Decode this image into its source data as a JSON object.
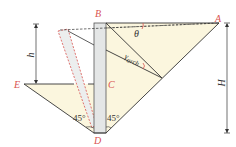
{
  "figure": {
    "type": "retaining-wall soil wedge diagram",
    "points": {
      "A": {
        "label": "A"
      },
      "B": {
        "label": "B"
      },
      "C": {
        "label": "C"
      },
      "D": {
        "label": "D"
      },
      "E": {
        "label": "E"
      }
    },
    "dimensions": {
      "h": {
        "label": "h"
      },
      "H": {
        "label": "H"
      }
    },
    "angles": {
      "theta": {
        "label": "θ"
      },
      "gamma_arch": {
        "label": "γ",
        "subscript": "arch"
      },
      "left_base": {
        "label": "45°"
      },
      "right_base": {
        "label": "45°"
      }
    },
    "colors": {
      "soil_fill": "#fbf6de",
      "wall_fill": "#e4e6e6",
      "line": "#333333",
      "label_red": "#d9534f",
      "dashed_wall": "#d9534f"
    }
  }
}
